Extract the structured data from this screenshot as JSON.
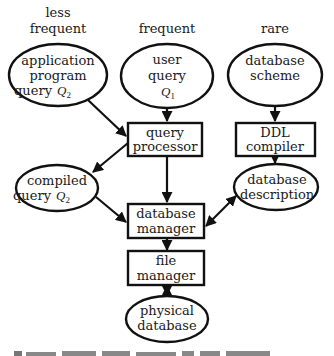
{
  "diagram": {
    "type": "flowchart",
    "column_headers": [
      {
        "id": "less_frequent",
        "lines": [
          "less",
          "frequent"
        ]
      },
      {
        "id": "frequent",
        "lines": [
          "frequent"
        ]
      },
      {
        "id": "rare",
        "lines": [
          "rare"
        ]
      }
    ],
    "nodes": {
      "app_query": {
        "shape": "ellipse",
        "lines": [
          "application",
          "program",
          "query"
        ],
        "math": "Q",
        "sub": "2"
      },
      "user_query": {
        "shape": "ellipse",
        "lines": [
          "user",
          "query"
        ],
        "math": "Q",
        "sub": "1"
      },
      "db_scheme": {
        "shape": "ellipse",
        "lines": [
          "database",
          "scheme"
        ]
      },
      "query_processor": {
        "shape": "box",
        "lines": [
          "query",
          "processor"
        ]
      },
      "ddl_compiler": {
        "shape": "box",
        "lines": [
          "DDL",
          "compiler"
        ]
      },
      "compiled_query": {
        "shape": "ellipse",
        "lines": [
          "compiled",
          "query"
        ],
        "math": "Q",
        "sub": "2"
      },
      "db_description": {
        "shape": "ellipse",
        "lines": [
          "database",
          "description"
        ]
      },
      "db_manager": {
        "shape": "box",
        "lines": [
          "database",
          "manager"
        ]
      },
      "file_manager": {
        "shape": "box",
        "lines": [
          "file",
          "manager"
        ]
      },
      "physical_db": {
        "shape": "ellipse",
        "lines": [
          "physical",
          "database"
        ]
      }
    },
    "edges": [
      {
        "from": "app_query",
        "to": "query_processor",
        "direction": "forward"
      },
      {
        "from": "user_query",
        "to": "query_processor",
        "direction": "forward"
      },
      {
        "from": "db_scheme",
        "to": "ddl_compiler",
        "direction": "forward"
      },
      {
        "from": "query_processor",
        "to": "compiled_query",
        "direction": "forward"
      },
      {
        "from": "query_processor",
        "to": "db_manager",
        "direction": "forward"
      },
      {
        "from": "ddl_compiler",
        "to": "db_description",
        "direction": "forward"
      },
      {
        "from": "compiled_query",
        "to": "db_manager",
        "direction": "forward"
      },
      {
        "from": "db_manager",
        "to": "db_description",
        "direction": "both"
      },
      {
        "from": "db_manager",
        "to": "file_manager",
        "direction": "forward"
      },
      {
        "from": "file_manager",
        "to": "physical_db",
        "direction": "both"
      }
    ],
    "caption": "(caption text cut off at bottom edge)"
  }
}
